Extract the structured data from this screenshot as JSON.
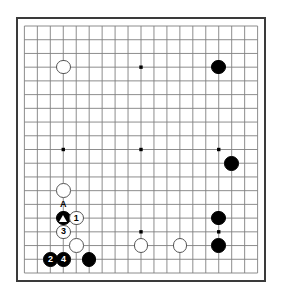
{
  "app": {
    "title": "Go Board Diagram",
    "board_type": "go-board",
    "size": 19,
    "background_color": "#ffffff",
    "line_color": "#808080",
    "border_color": "#3a3a3a",
    "black_color": "#000000",
    "white_color": "#ffffff"
  },
  "board": {
    "columns": 19,
    "rows": 19,
    "star_points": [
      {
        "col": 4,
        "row": 4
      },
      {
        "col": 10,
        "row": 4
      },
      {
        "col": 16,
        "row": 4
      },
      {
        "col": 4,
        "row": 10
      },
      {
        "col": 10,
        "row": 10
      },
      {
        "col": 16,
        "row": 10
      },
      {
        "col": 4,
        "row": 16
      },
      {
        "col": 10,
        "row": 16
      },
      {
        "col": 16,
        "row": 16
      }
    ],
    "stones": [
      {
        "id": "w-top-left",
        "color": "white",
        "col": 4,
        "row": 4,
        "label": "",
        "size": "large"
      },
      {
        "id": "b-top-right",
        "color": "black",
        "col": 16,
        "row": 4,
        "label": "",
        "size": "large"
      },
      {
        "id": "b-right-mid",
        "color": "black",
        "col": 17,
        "row": 11,
        "label": "",
        "size": "large"
      },
      {
        "id": "w-left-upper",
        "color": "white",
        "col": 4,
        "row": 13,
        "label": "",
        "size": "large"
      },
      {
        "id": "b-triangle",
        "color": "black",
        "col": 4,
        "row": 15,
        "label": "",
        "size": "large",
        "mark": "triangle"
      },
      {
        "id": "w-move-1",
        "color": "white",
        "col": 5,
        "row": 15,
        "label": "1",
        "size": "large"
      },
      {
        "id": "w-move-3",
        "color": "white",
        "col": 4,
        "row": 16,
        "label": "3",
        "size": "large"
      },
      {
        "id": "w-left-lower",
        "color": "white",
        "col": 5,
        "row": 17,
        "label": "",
        "size": "large"
      },
      {
        "id": "b-move-2",
        "color": "black",
        "col": 3,
        "row": 18,
        "label": "2",
        "size": "large"
      },
      {
        "id": "b-move-4",
        "color": "black",
        "col": 4,
        "row": 18,
        "label": "4",
        "size": "large"
      },
      {
        "id": "b-bottom-left",
        "color": "black",
        "col": 6,
        "row": 18,
        "label": "",
        "size": "large"
      },
      {
        "id": "w-bottom-mid-1",
        "color": "white",
        "col": 10,
        "row": 17,
        "label": "",
        "size": "large"
      },
      {
        "id": "w-bottom-mid-2",
        "color": "white",
        "col": 13,
        "row": 17,
        "label": "",
        "size": "large"
      },
      {
        "id": "b-bottom-right-1",
        "color": "black",
        "col": 16,
        "row": 15,
        "label": "",
        "size": "large"
      },
      {
        "id": "b-bottom-right-2",
        "color": "black",
        "col": 16,
        "row": 17,
        "label": "",
        "size": "large"
      }
    ],
    "annotations": [
      {
        "id": "point-a",
        "text": "A",
        "col": 4,
        "row": 14
      }
    ]
  },
  "move_sequence": {
    "moves": [
      {
        "number": "1",
        "color": "white"
      },
      {
        "number": "2",
        "color": "black"
      },
      {
        "number": "3",
        "color": "white"
      },
      {
        "number": "4",
        "color": "black"
      }
    ]
  }
}
